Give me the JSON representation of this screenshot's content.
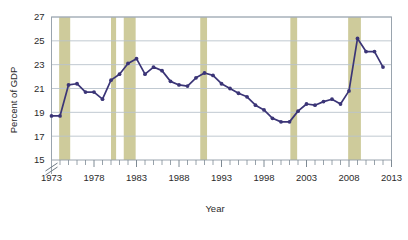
{
  "chart_data": {
    "type": "line",
    "title": "",
    "subtitle": "",
    "xlabel": "Year",
    "ylabel": "Percent of GDP",
    "xlim": [
      1973,
      2013
    ],
    "ylim": [
      15,
      27
    ],
    "ytick_labels": [
      "15",
      "17",
      "19",
      "21",
      "23",
      "25",
      "27"
    ],
    "yticks": [
      15,
      17,
      19,
      21,
      23,
      25,
      27
    ],
    "xtick_labels": [
      "1973",
      "1978",
      "1983",
      "1988",
      "1993",
      "1998",
      "2003",
      "2008",
      "2013"
    ],
    "xticks": [
      1973,
      1978,
      1983,
      1988,
      1993,
      1998,
      2003,
      2008,
      2013
    ],
    "minor_xtick_interval": 1,
    "grid": "horizontal",
    "y_axis_break": true,
    "legend": "none",
    "series": [
      {
        "name": "Federal spending",
        "color": "#3b3577",
        "marker": "circle",
        "x": [
          1973,
          1974,
          1975,
          1976,
          1977,
          1978,
          1979,
          1980,
          1981,
          1982,
          1983,
          1984,
          1985,
          1986,
          1987,
          1988,
          1989,
          1990,
          1991,
          1992,
          1993,
          1994,
          1995,
          1996,
          1997,
          1998,
          1999,
          2000,
          2001,
          2002,
          2003,
          2004,
          2005,
          2006,
          2007,
          2008,
          2009,
          2010,
          2011,
          2012
        ],
        "values": [
          18.7,
          18.7,
          21.3,
          21.4,
          20.7,
          20.7,
          20.1,
          21.7,
          22.2,
          23.1,
          23.5,
          22.2,
          22.8,
          22.5,
          21.6,
          21.3,
          21.2,
          21.9,
          22.3,
          22.1,
          21.4,
          21.0,
          20.6,
          20.3,
          19.6,
          19.2,
          18.5,
          18.2,
          18.2,
          19.1,
          19.7,
          19.6,
          19.9,
          20.1,
          19.7,
          20.8,
          25.2,
          24.1,
          24.1,
          22.8
        ]
      }
    ],
    "shaded_bands": {
      "name": "recession-bands",
      "color": "#cecb9b",
      "ranges": [
        {
          "start": 1973.9,
          "end": 1975.2
        },
        {
          "start": 1980.0,
          "end": 1980.6
        },
        {
          "start": 1981.5,
          "end": 1982.9
        },
        {
          "start": 1990.5,
          "end": 1991.3
        },
        {
          "start": 2001.1,
          "end": 2001.9
        },
        {
          "start": 2007.9,
          "end": 2009.4
        }
      ]
    },
    "colors": {
      "line": "#3b3577",
      "marker": "#3b3577",
      "band": "#cecb9b",
      "grid": "#b9c3cc",
      "frame": "#9aa4ae",
      "background": "#ffffff",
      "text": "#2b2b2b"
    }
  }
}
